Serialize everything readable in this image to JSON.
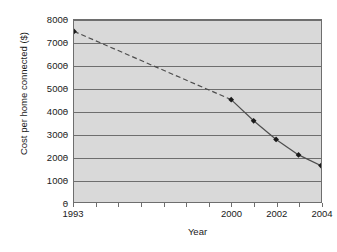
{
  "chart_data": {
    "type": "line",
    "title": "",
    "xlabel": "Year",
    "ylabel": "Cost per home connected ($)",
    "xlim": [
      1993,
      2004
    ],
    "ylim": [
      0,
      8000
    ],
    "grid": true,
    "legend": "none",
    "y_ticks": [
      0,
      1000,
      2000,
      3000,
      4000,
      5000,
      6000,
      7000,
      8000
    ],
    "y_tick_labels": [
      "0",
      "1000",
      "2000",
      "3000",
      "4000",
      "5000",
      "6000",
      "7000",
      "8000"
    ],
    "x_ticks": [
      1993,
      1994,
      1995,
      1996,
      1997,
      1998,
      1999,
      2000,
      2001,
      2002,
      2003,
      2004
    ],
    "x_tick_labels_shown": [
      {
        "year": 1993,
        "label": "1993"
      },
      {
        "year": 2000,
        "label": "2000"
      },
      {
        "year": 2002,
        "label": "2002"
      },
      {
        "year": 2004,
        "label": "2004"
      }
    ],
    "x": [
      1993,
      2000,
      2001,
      2002,
      2003,
      2004
    ],
    "values": [
      7500,
      4500,
      3570,
      2750,
      2070,
      1600
    ],
    "series": [
      {
        "name": "Cost per home connected",
        "x": [
          1993,
          2000,
          2001,
          2002,
          2003,
          2004
        ],
        "values": [
          7500,
          4500,
          3570,
          2750,
          2070,
          1600
        ],
        "marker": "filled-diamond",
        "marker_color": "#1a1a1a",
        "line_color": "#4d4d4d",
        "segments": [
          {
            "from": 1993,
            "to": 2000,
            "style": "dashed"
          },
          {
            "from": 2000,
            "to": 2001,
            "style": "solid"
          },
          {
            "from": 2001,
            "to": 2002,
            "style": "solid"
          },
          {
            "from": 2002,
            "to": 2003,
            "style": "solid"
          },
          {
            "from": 2003,
            "to": 2004,
            "style": "solid"
          }
        ]
      }
    ],
    "colors": {
      "plot_background": "#d9d9d9",
      "grid": "#6e6e6e",
      "axis": "#6e6e6e",
      "text": "#1a1a1a",
      "line": "#4d4d4d",
      "marker": "#1a1a1a"
    }
  },
  "axes": {
    "y_title": "Cost per home connected ($)",
    "x_title": "Year"
  },
  "caption": {
    "text": ""
  }
}
